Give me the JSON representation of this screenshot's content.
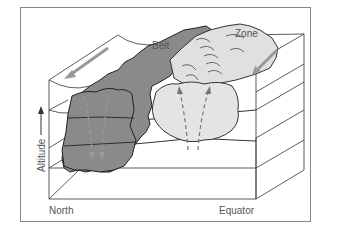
{
  "figure": {
    "labels": {
      "belt": "Belt",
      "zone": "Zone",
      "altitude": "Altitude",
      "north": "North",
      "equator": "Equator"
    },
    "colors": {
      "belt_fill": "#8a8a8a",
      "zone_fill": "#e2e2e2",
      "lines": "#333333",
      "frame": "#777777",
      "arrows": "#999999",
      "text": "#555555"
    },
    "annotations": [
      "Arrow on top-left surface pointing west (toward front-left)",
      "Arrow on zone top pointing toward front-right",
      "Belt: downward dashed arrows (sinking air)",
      "Zone: upward dashed arrows (rising air)"
    ]
  }
}
